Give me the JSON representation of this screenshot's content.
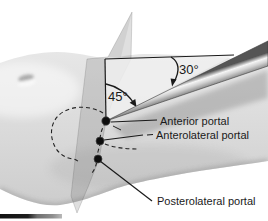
{
  "diagram": {
    "angles": {
      "needle_to_horizontal": "30°",
      "plane_to_needle": "45°"
    },
    "portals": [
      {
        "label": "Anterior portal"
      },
      {
        "label": "Anterolateral portal"
      },
      {
        "label": "Posterolateral portal"
      }
    ],
    "colors": {
      "background": "#ffffff",
      "limb_skin": "#d9d9d9",
      "plane_tint": "#c9c9c9",
      "triangle_fill": "#eeeeee",
      "instrument_dark": "#4f4f4f",
      "instrument_light": "#f5f5f5",
      "ink": "#1a1a1a"
    }
  }
}
